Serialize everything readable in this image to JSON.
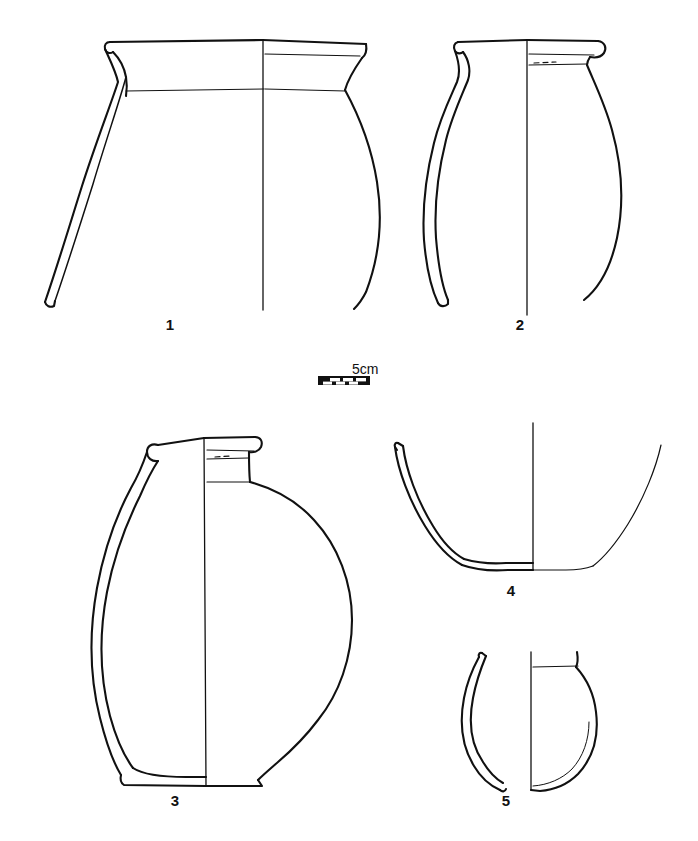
{
  "plate": {
    "kind": "archaeological-pottery-profile-plate",
    "background_color": "#ffffff",
    "ink_color": "#111111",
    "width": 698,
    "height": 841
  },
  "scale": {
    "caption": "5cm",
    "bar_segments": 4,
    "bar_color": "#111111",
    "bar_x": 318,
    "bar_y": 376,
    "bar_width": 52,
    "bar_height": 9
  },
  "figures": [
    {
      "id": "fig-1",
      "label": "1",
      "description": "Wide-mouthed globular jar with everted flaring rim; left half shows section wall, right half shows exterior profile; lower body broken.",
      "label_x": 170,
      "label_y": 323
    },
    {
      "id": "fig-2",
      "label": "2",
      "description": "Globular jar with thickened rolled rim and short neck; section at left, exterior profile at right; base missing.",
      "label_x": 520,
      "label_y": 323
    },
    {
      "id": "fig-3",
      "label": "3",
      "description": "Large squat globular flask with cylindrical collared neck and flat base.",
      "label_x": 175,
      "label_y": 799
    },
    {
      "id": "fig-4",
      "label": "4",
      "description": "Open bowl base sherd with flaring walls and flat base.",
      "label_x": 511,
      "label_y": 589
    },
    {
      "id": "fig-5",
      "label": "5",
      "description": "Small closed vessel with rounded base and short incurving rim.",
      "label_x": 506,
      "label_y": 799
    }
  ]
}
